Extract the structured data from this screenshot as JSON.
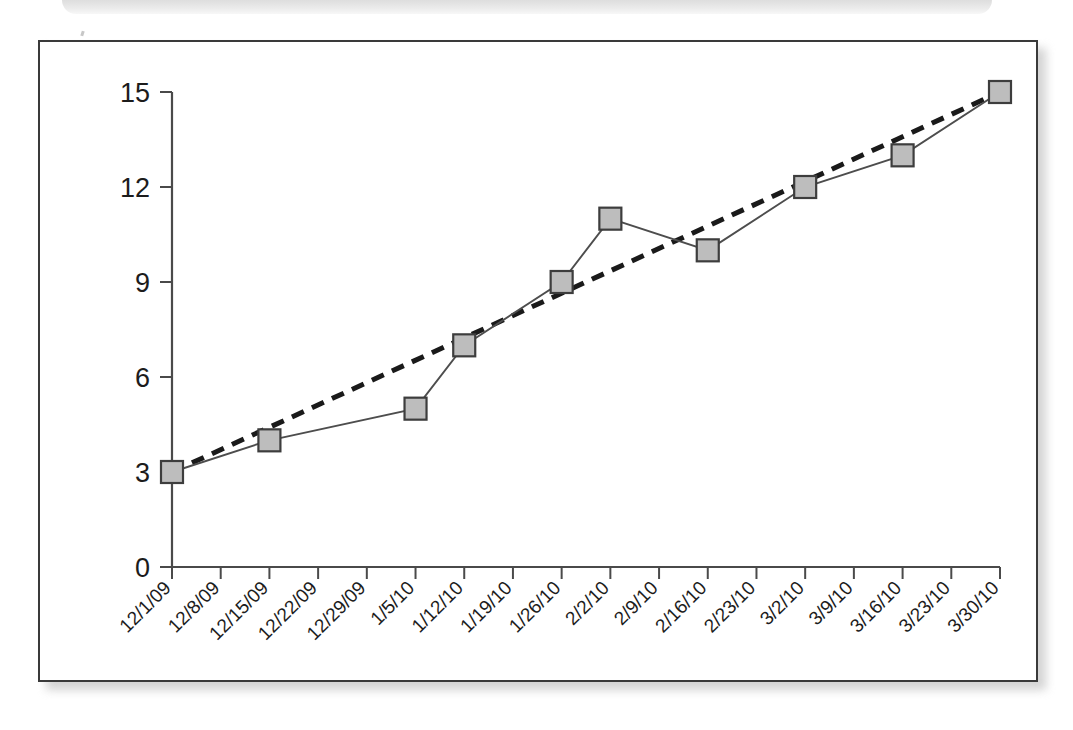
{
  "page": {
    "background_color": "#ffffff",
    "frame_border_color": "#3a3a3a",
    "shadow_color": "#b0b0b0"
  },
  "chart_data": {
    "type": "line",
    "title": "",
    "subtitle": "",
    "xlabel": "",
    "ylabel": "",
    "ylim": [
      0,
      15
    ],
    "yticks": [
      0,
      3,
      6,
      9,
      12,
      15
    ],
    "ytick_labels": [
      "0",
      "3",
      "6",
      "9",
      "12",
      "15"
    ],
    "grid": false,
    "legend": "none",
    "xtick_rotation_deg": -45,
    "categories": [
      "12/1/09",
      "12/8/09",
      "12/15/09",
      "12/22/09",
      "12/29/09",
      "1/5/10",
      "1/12/10",
      "1/19/10",
      "1/26/10",
      "2/2/10",
      "2/9/10",
      "2/16/10",
      "2/23/10",
      "3/2/10",
      "3/9/10",
      "3/16/10",
      "3/23/10",
      "3/30/10"
    ],
    "series": [
      {
        "name": "data",
        "style": "solid-line-with-square-markers",
        "marker": "square",
        "marker_fill_color": "#bdbdbd",
        "marker_edge_color": "#3d3d3d",
        "line_color": "#4d4d4d",
        "points": [
          {
            "x": "12/1/09",
            "x_index": 0,
            "y": 3
          },
          {
            "x": "12/15/09",
            "x_index": 2,
            "y": 4
          },
          {
            "x": "1/5/10",
            "x_index": 5,
            "y": 5
          },
          {
            "x": "1/12/10",
            "x_index": 6,
            "y": 7
          },
          {
            "x": "1/26/10",
            "x_index": 8,
            "y": 9
          },
          {
            "x": "2/2/10",
            "x_index": 9,
            "y": 11
          },
          {
            "x": "2/16/10",
            "x_index": 11,
            "y": 10
          },
          {
            "x": "3/2/10",
            "x_index": 13,
            "y": 12
          },
          {
            "x": "3/16/10",
            "x_index": 15,
            "y": 13
          },
          {
            "x": "3/30/10",
            "x_index": 17,
            "y": 15
          }
        ]
      },
      {
        "name": "trendline",
        "style": "dashed-line",
        "line_color": "#1a1a1a",
        "points": [
          {
            "x": "12/1/09",
            "x_index": 0,
            "y": 3
          },
          {
            "x": "3/30/10",
            "x_index": 17,
            "y": 15
          }
        ]
      }
    ]
  }
}
